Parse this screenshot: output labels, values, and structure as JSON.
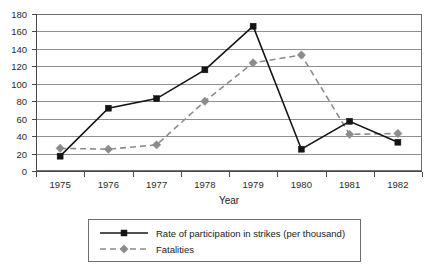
{
  "chart_data": {
    "type": "line",
    "title": "",
    "xlabel": "Year",
    "ylabel": "",
    "categories": [
      "1975",
      "1976",
      "1977",
      "1978",
      "1979",
      "1980",
      "1981",
      "1982"
    ],
    "ylim": [
      0,
      180
    ],
    "ytick_step": 20,
    "yticks": [
      "0",
      "20",
      "40",
      "60",
      "80",
      "100",
      "120",
      "140",
      "160",
      "180"
    ],
    "grid": "horizontal",
    "legend_position": "bottom",
    "series": [
      {
        "name": "Rate of participation in strikes (per thousand)",
        "style": "solid",
        "marker": "square",
        "color": "#141414",
        "values": [
          17,
          72,
          83,
          116,
          166,
          25,
          57,
          33
        ]
      },
      {
        "name": "Fatalities",
        "style": "dashed",
        "marker": "diamond",
        "color": "#8c8c8c",
        "values": [
          26,
          25,
          30,
          80,
          124,
          133,
          42,
          43
        ]
      }
    ]
  },
  "axes": {
    "x_title": "Year"
  },
  "legend": {
    "entries": [
      {
        "label": "Rate of participation in strikes (per thousand)"
      },
      {
        "label": "Fatalities"
      }
    ]
  }
}
